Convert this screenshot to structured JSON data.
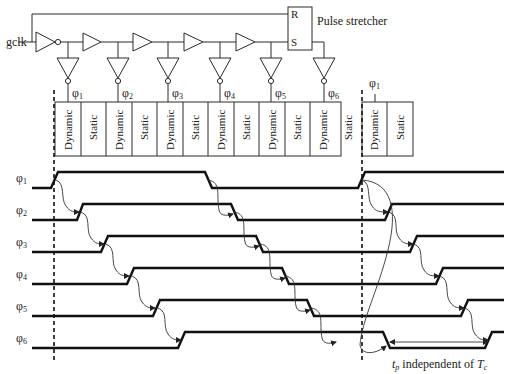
{
  "circuit": {
    "input_label": "gclk",
    "latch": {
      "label": "Pulse stretcher",
      "r_pin": "R",
      "s_pin": "S"
    },
    "taps": [
      {
        "phase": "φ",
        "sub": "1"
      },
      {
        "phase": "φ",
        "sub": "2"
      },
      {
        "phase": "φ",
        "sub": "3"
      },
      {
        "phase": "φ",
        "sub": "4"
      },
      {
        "phase": "φ",
        "sub": "5"
      },
      {
        "phase": "φ",
        "sub": "6"
      }
    ],
    "next_cycle_tap": {
      "phase": "φ",
      "sub": "1"
    }
  },
  "pipeline_blocks": [
    "Dynamic",
    "Static",
    "Dynamic",
    "Static",
    "Dynamic",
    "Static",
    "Dynamic",
    "Static",
    "Dynamic",
    "Static",
    "Dynamic",
    "Static",
    "Dynamic",
    "Static"
  ],
  "timing": {
    "signals": [
      {
        "name": "φ",
        "sub": "1"
      },
      {
        "name": "φ",
        "sub": "2"
      },
      {
        "name": "φ",
        "sub": "3"
      },
      {
        "name": "φ",
        "sub": "4"
      },
      {
        "name": "φ",
        "sub": "5"
      },
      {
        "name": "φ",
        "sub": "6"
      }
    ],
    "annotation": {
      "t": "t",
      "t_sub": "p",
      "text": " independent of ",
      "T": "T",
      "T_sub": "c"
    }
  },
  "colors": {
    "line": "#111111",
    "background": "#ffffff"
  }
}
